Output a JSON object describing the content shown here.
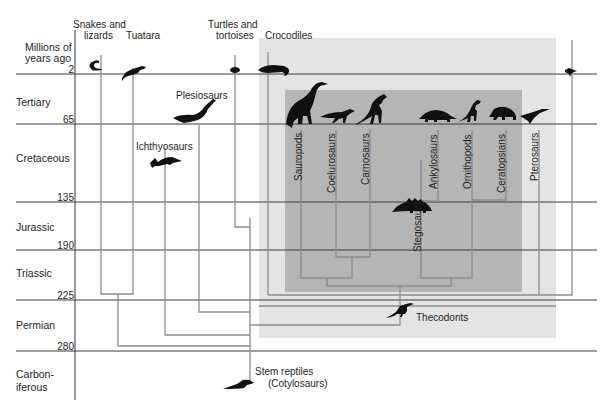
{
  "axis": {
    "title_line1": "Millions of",
    "title_line2": "years ago",
    "ticks": [
      {
        "value": "2",
        "y": 74
      },
      {
        "value": "65",
        "y": 124
      },
      {
        "value": "135",
        "y": 202
      },
      {
        "value": "190",
        "y": 250
      },
      {
        "value": "225",
        "y": 300
      },
      {
        "value": "280",
        "y": 351
      }
    ]
  },
  "periods": [
    {
      "name": "Tertiary",
      "y": 98
    },
    {
      "name": "Cretaceous",
      "y": 157
    },
    {
      "name": "Jurassic",
      "y": 223
    },
    {
      "name": "Triassic",
      "y": 271
    },
    {
      "name": "Permian",
      "y": 322
    },
    {
      "name": "Carbon-",
      "name2": "iferous",
      "y": 366
    }
  ],
  "groups_top": {
    "snakes_lizards_1": "Snakes and",
    "snakes_lizards_2": "lizards",
    "tuatara": "Tuatara",
    "turtles_1": "Turtles and",
    "turtles_2": "tortoises",
    "crocodiles": "Crocodiles"
  },
  "groups_mid": {
    "plesiosaurs": "Plesiosaurs",
    "ichthyosaurs": "Ichthyosaurs",
    "thecodonts": "Thecodonts",
    "stem_1": "Stem reptiles",
    "stem_2": "(Cotylosaurs)"
  },
  "dinosaur_groups": [
    {
      "name": "Sauropods"
    },
    {
      "name": "Coelurosaurs"
    },
    {
      "name": "Carnosaurs"
    },
    {
      "name": "Stegosaurs"
    },
    {
      "name": "Ankylosaurs"
    },
    {
      "name": "Ornithopods"
    },
    {
      "name": "Ceratopsians"
    },
    {
      "name": "Pterosaurs"
    }
  ],
  "colors": {
    "outer_box": "#e4e4e4",
    "inner_box": "#b4b4b4",
    "branch_line": "#8c8c8c",
    "grid_line": "#3a3a3a",
    "silhouette": "#111111"
  }
}
